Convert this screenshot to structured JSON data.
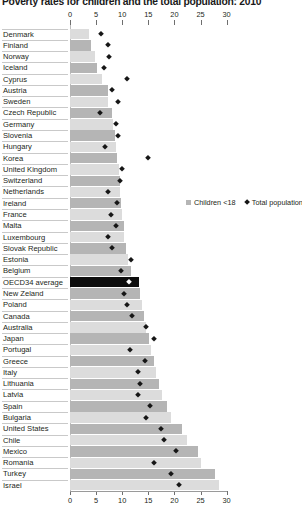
{
  "title": "Poverty rates for children and the total population: 2010",
  "legend": {
    "children_label": "Children <18",
    "total_label": "Total population",
    "children_color": "#b5b5b5",
    "total_color": "#161616"
  },
  "axis": {
    "ticks": [
      "0",
      "5",
      "10",
      "15",
      "20",
      "25",
      "30"
    ],
    "min": 0,
    "max": 30
  },
  "chart_data": {
    "type": "bar",
    "title": "Poverty rates for children and the total population: 2010",
    "xlabel": "",
    "ylabel": "",
    "xlim": [
      0,
      30
    ],
    "grid": false,
    "legend_position": "middle-right",
    "orientation": "horizontal",
    "categories": [
      "Denmark",
      "Finland",
      "Norway",
      "Iceland",
      "Cyprus",
      "Austria",
      "Sweden",
      "Czech Republic",
      "Germany",
      "Slovenia",
      "Hungary",
      "Korea",
      "United Kingdom",
      "Switzerland",
      "Netherlands",
      "Ireland",
      "France",
      "Malta",
      "Luxembourg",
      "Slovak Republic",
      "Estonia",
      "Belgium",
      "OECD34 average",
      "New Zeland",
      "Poland",
      "Canada",
      "Australia",
      "Japan",
      "Portugal",
      "Greece",
      "Italy",
      "Lithuania",
      "Latvia",
      "Spain",
      "Bulgaria",
      "United States",
      "Chile",
      "Mexico",
      "Romania",
      "Turkey",
      "Israel"
    ],
    "series": [
      {
        "name": "Children <18",
        "values": [
          3.7,
          4.0,
          4.8,
          5.1,
          6.1,
          7.3,
          7.3,
          8.0,
          8.3,
          8.6,
          8.8,
          9.0,
          9.4,
          9.5,
          9.6,
          9.8,
          10.0,
          10.3,
          10.4,
          10.8,
          11.2,
          11.6,
          13.2,
          13.5,
          13.8,
          14.2,
          14.6,
          15.2,
          15.6,
          16.0,
          16.5,
          17.0,
          17.6,
          18.6,
          19.4,
          21.4,
          22.5,
          24.5,
          25.0,
          27.8,
          28.5
        ],
        "color": "#b5b5b5"
      },
      {
        "name": "Total population",
        "values": [
          6.0,
          7.3,
          7.5,
          6.5,
          11.0,
          8.1,
          9.1,
          5.8,
          8.8,
          9.2,
          6.8,
          14.9,
          10.0,
          9.5,
          7.2,
          9.0,
          7.9,
          8.8,
          7.2,
          8.1,
          11.7,
          9.7,
          11.3,
          10.3,
          11.0,
          11.9,
          14.5,
          16.0,
          11.4,
          14.3,
          13.0,
          13.4,
          13.0,
          15.4,
          14.5,
          17.4,
          18.0,
          20.4,
          16.0,
          19.3,
          20.9
        ],
        "color": "#161616"
      }
    ],
    "highlight_category": "OECD34 average",
    "highlight_color": "#0d0d0d"
  }
}
